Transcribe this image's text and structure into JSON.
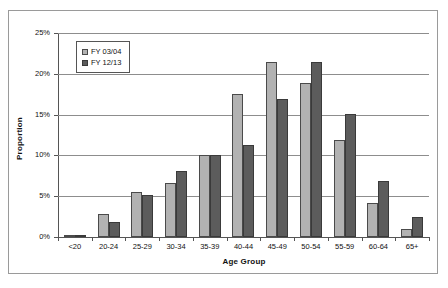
{
  "chart_data": {
    "type": "bar",
    "title": "",
    "xlabel": "Age Group",
    "ylabel": "Proportion",
    "categories": [
      "<20",
      "20-24",
      "25-29",
      "30-34",
      "35-39",
      "40-44",
      "45-49",
      "50-54",
      "55-59",
      "60-64",
      "65+"
    ],
    "series": [
      {
        "name": "FY 03/04",
        "color": "#b2b2b2",
        "values": [
          0.3,
          2.8,
          5.5,
          6.6,
          10.0,
          17.5,
          21.5,
          18.9,
          11.9,
          4.2,
          1.0
        ]
      },
      {
        "name": "FY 12/13",
        "color": "#5c5c5c",
        "values": [
          0.2,
          1.9,
          5.2,
          8.1,
          10.1,
          11.3,
          16.9,
          21.5,
          15.1,
          6.9,
          2.4
        ]
      }
    ],
    "ylim": [
      0,
      25
    ],
    "ytick_values": [
      0,
      5,
      10,
      15,
      20,
      25
    ],
    "ytick_labels": [
      "0%",
      "5%",
      "10%",
      "15%",
      "20%",
      "25%"
    ],
    "grid": true,
    "legend_position": "upper-left-inside"
  }
}
